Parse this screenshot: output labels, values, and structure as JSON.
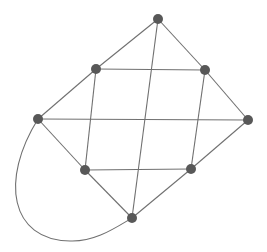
{
  "diagram": {
    "type": "graph",
    "colors": {
      "edge": "#707070",
      "node": "#585858",
      "background": "#ffffff"
    },
    "node_radius": 5,
    "nodes": [
      {
        "id": "top",
        "x": 158,
        "y": 19
      },
      {
        "id": "upper-left",
        "x": 96,
        "y": 69
      },
      {
        "id": "upper-right",
        "x": 205,
        "y": 70
      },
      {
        "id": "left",
        "x": 38,
        "y": 119
      },
      {
        "id": "right",
        "x": 248,
        "y": 120
      },
      {
        "id": "lower-left",
        "x": 85,
        "y": 170
      },
      {
        "id": "lower-right",
        "x": 191,
        "y": 169
      },
      {
        "id": "bottom",
        "x": 132,
        "y": 218
      }
    ],
    "edges": [
      {
        "from": "top",
        "to": "upper-left"
      },
      {
        "from": "top",
        "to": "upper-right"
      },
      {
        "from": "top",
        "to": "bottom"
      },
      {
        "from": "upper-left",
        "to": "upper-right"
      },
      {
        "from": "upper-left",
        "to": "left"
      },
      {
        "from": "upper-left",
        "to": "lower-left"
      },
      {
        "from": "upper-right",
        "to": "right"
      },
      {
        "from": "upper-right",
        "to": "lower-right"
      },
      {
        "from": "left",
        "to": "right"
      },
      {
        "from": "left",
        "to": "lower-left"
      },
      {
        "from": "right",
        "to": "lower-right"
      },
      {
        "from": "lower-left",
        "to": "lower-right"
      },
      {
        "from": "lower-left",
        "to": "bottom"
      },
      {
        "from": "lower-right",
        "to": "bottom"
      },
      {
        "from": "left",
        "to": "bottom",
        "curved": true,
        "path": "M38,119 C0,180 10,240 70,241 C95,242 115,228 132,218"
      }
    ]
  }
}
